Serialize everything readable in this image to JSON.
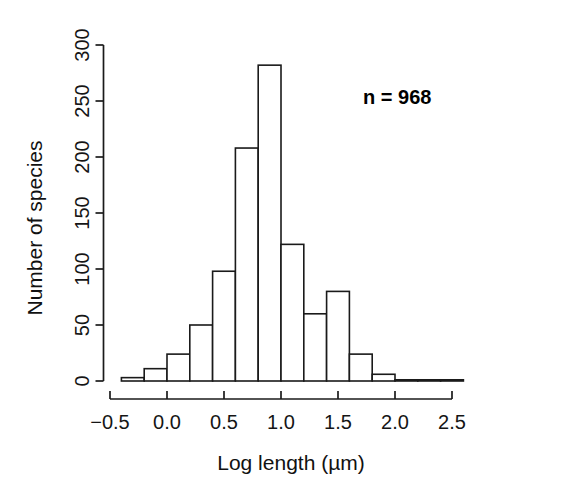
{
  "chart_data": {
    "type": "bar",
    "title": "",
    "subtitle": "",
    "xlabel": "Log length (µm)",
    "ylabel": "Number of species",
    "xlim": [
      -0.55,
      2.62
    ],
    "ylim": [
      0,
      300
    ],
    "grid": false,
    "legend": null,
    "bin_width": 0.2,
    "bin_edges": [
      -0.4,
      -0.2,
      0.0,
      0.2,
      0.4,
      0.6,
      0.8,
      1.0,
      1.2,
      1.4,
      1.6,
      1.8,
      2.0,
      2.2,
      2.4,
      2.6
    ],
    "categories": [
      "-0.4 to -0.2",
      "-0.2 to 0.0",
      "0.0 to 0.2",
      "0.2 to 0.4",
      "0.4 to 0.6",
      "0.6 to 0.8",
      "0.8 to 1.0",
      "1.0 to 1.2",
      "1.2 to 1.4",
      "1.4 to 1.6",
      "1.6 to 1.8",
      "1.8 to 2.0",
      "2.0 to 2.2",
      "2.2 to 2.4",
      "2.4 to 2.6"
    ],
    "values": [
      3,
      11,
      24,
      50,
      98,
      208,
      282,
      122,
      60,
      80,
      24,
      6,
      0,
      0,
      1
    ],
    "xticks": [
      -0.5,
      0.0,
      0.5,
      1.0,
      1.5,
      2.0,
      2.5
    ],
    "xtick_labels": [
      "-0.5",
      "0.0",
      "0.5",
      "1.0",
      "1.5",
      "2.0",
      "2.5"
    ],
    "yticks": [
      0,
      50,
      100,
      150,
      200,
      250,
      300
    ],
    "ytick_labels": [
      "0",
      "50",
      "100",
      "150",
      "200",
      "250",
      "300"
    ],
    "annotations": [
      {
        "text": "n = 968",
        "x": 1.72,
        "y": 247
      }
    ],
    "colors": {
      "bar_fill": "#ffffff",
      "bar_stroke": "#1a1a1a",
      "axis": "#1a1a1a",
      "text": "#111111",
      "background": "#ffffff"
    }
  }
}
